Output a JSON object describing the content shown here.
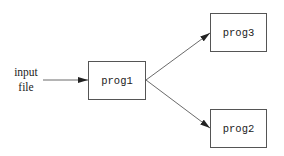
{
  "diagram": {
    "input_label_line1": "input",
    "input_label_line2": "file",
    "nodes": [
      {
        "id": "prog1",
        "label": "prog1"
      },
      {
        "id": "prog3",
        "label": "prog3"
      },
      {
        "id": "prog2",
        "label": "prog2"
      }
    ],
    "edges": [
      {
        "from": "input file",
        "to": "prog1"
      },
      {
        "from": "prog1",
        "to": "prog3"
      },
      {
        "from": "prog1",
        "to": "prog2"
      }
    ]
  }
}
